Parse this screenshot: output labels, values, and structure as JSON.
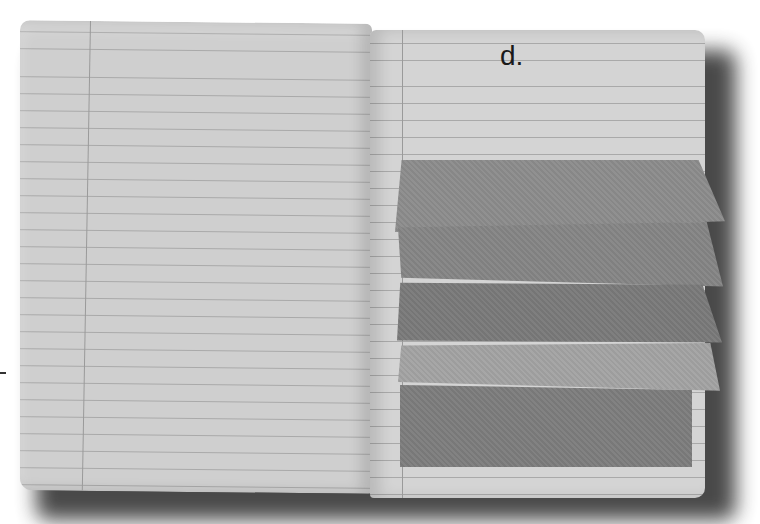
{
  "image": {
    "description": "Open lined notebook with layered paper flaps on the right page",
    "right_page": {
      "heading": "d."
    },
    "flaps": [
      {
        "shade": "#8c8c8c"
      },
      {
        "shade": "#858585"
      },
      {
        "shade": "#7a7a7a"
      },
      {
        "shade": "#a3a3a3"
      },
      {
        "shade": "#7d7d7d"
      }
    ],
    "colors": {
      "page": "#cfcfcf",
      "ruling": "#a9a9a9",
      "background": "#ffffff"
    }
  }
}
